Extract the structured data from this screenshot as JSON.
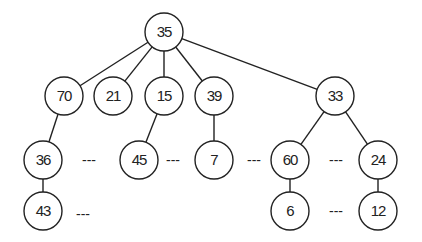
{
  "diagram": {
    "type": "tree",
    "nodes": [
      {
        "id": "n35",
        "label": "35",
        "x": 164,
        "y": 32
      },
      {
        "id": "n70",
        "label": "70",
        "x": 64,
        "y": 96
      },
      {
        "id": "n21",
        "label": "21",
        "x": 113,
        "y": 96
      },
      {
        "id": "n15",
        "label": "15",
        "x": 164,
        "y": 96
      },
      {
        "id": "n39",
        "label": "39",
        "x": 214,
        "y": 96
      },
      {
        "id": "n33",
        "label": "33",
        "x": 335,
        "y": 96
      },
      {
        "id": "n36",
        "label": "36",
        "x": 43,
        "y": 160
      },
      {
        "id": "n45",
        "label": "45",
        "x": 139,
        "y": 160
      },
      {
        "id": "n7",
        "label": "7",
        "x": 214,
        "y": 160
      },
      {
        "id": "n60",
        "label": "60",
        "x": 290,
        "y": 160
      },
      {
        "id": "n24",
        "label": "24",
        "x": 378,
        "y": 160
      },
      {
        "id": "n43",
        "label": "43",
        "x": 43,
        "y": 211
      },
      {
        "id": "n6",
        "label": "6",
        "x": 290,
        "y": 211
      },
      {
        "id": "n12",
        "label": "12",
        "x": 378,
        "y": 211
      }
    ],
    "edges": [
      [
        "n35",
        "n70"
      ],
      [
        "n35",
        "n21"
      ],
      [
        "n35",
        "n15"
      ],
      [
        "n35",
        "n39"
      ],
      [
        "n35",
        "n33"
      ],
      [
        "n70",
        "n36"
      ],
      [
        "n15",
        "n45"
      ],
      [
        "n39",
        "n7"
      ],
      [
        "n33",
        "n60"
      ],
      [
        "n33",
        "n24"
      ],
      [
        "n36",
        "n43"
      ],
      [
        "n60",
        "n6"
      ],
      [
        "n24",
        "n12"
      ]
    ],
    "ellipses": [
      {
        "label": "---",
        "x": 89,
        "y": 165
      },
      {
        "label": "---",
        "x": 173,
        "y": 165
      },
      {
        "label": "---",
        "x": 254,
        "y": 165
      },
      {
        "label": "---",
        "x": 336,
        "y": 165
      },
      {
        "label": "---",
        "x": 83,
        "y": 219
      },
      {
        "label": "---",
        "x": 336,
        "y": 216
      }
    ]
  }
}
